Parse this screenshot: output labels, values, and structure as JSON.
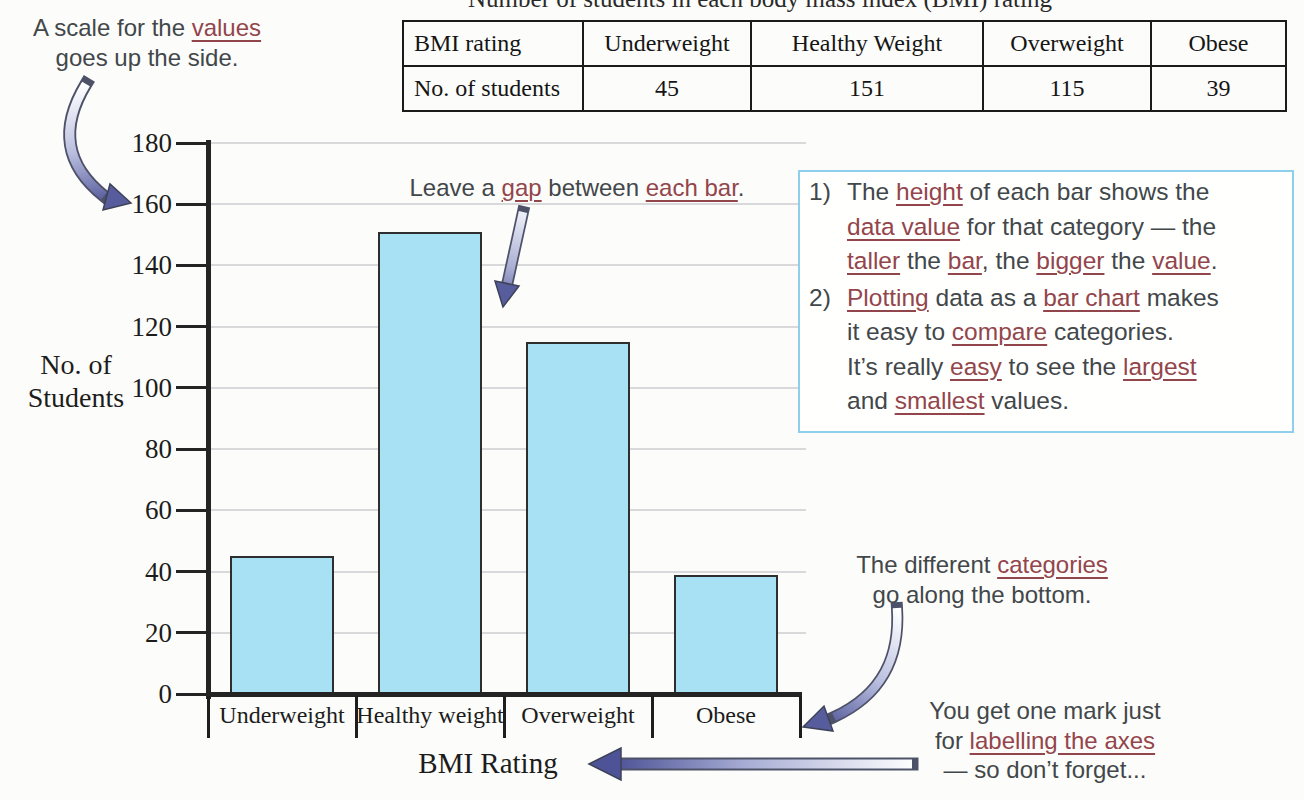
{
  "page": {
    "background": "#fcfcfa"
  },
  "colors": {
    "maroon": "#93454c",
    "text_dark": "#42474a",
    "serif_text": "#1c1c1c",
    "box_border": "#8ecfec",
    "arrow_outline": "#4e5268",
    "arrow_head": "#565c9c",
    "bar_fill": "#a8e1f3",
    "bar_border": "#2e2e2e",
    "grid": "#d8d9da",
    "axis": "#242424"
  },
  "top_caption": {
    "text": "Number of students in each body mass index (BMI) rating"
  },
  "table": {
    "rows": [
      {
        "cells": [
          "BMI rating",
          "Underweight",
          "Healthy Weight",
          "Overweight",
          "Obese"
        ]
      },
      {
        "cells": [
          "No. of students",
          "45",
          "151",
          "115",
          "39"
        ]
      }
    ]
  },
  "annotations": {
    "scale": {
      "lines": [
        [
          {
            "t": "A scale for the "
          },
          {
            "t": "values",
            "u": true
          }
        ],
        [
          {
            "t": "goes up the side."
          }
        ]
      ]
    },
    "gap": {
      "lines": [
        [
          {
            "t": "Leave a "
          },
          {
            "t": "gap",
            "u": true
          },
          {
            "t": " between "
          },
          {
            "t": "each bar",
            "u": true
          },
          {
            "t": "."
          }
        ]
      ]
    },
    "categories": {
      "lines": [
        [
          {
            "t": "The different "
          },
          {
            "t": "categories",
            "u": true
          }
        ],
        [
          {
            "t": "go along the bottom."
          }
        ]
      ]
    },
    "marks": {
      "lines": [
        [
          {
            "t": "You get one mark just"
          }
        ],
        [
          {
            "t": "for "
          },
          {
            "t": "labelling the axes",
            "u": true
          }
        ],
        [
          {
            "t": "— so don’t forget..."
          }
        ]
      ]
    }
  },
  "info_box": {
    "items": [
      {
        "num": "1)",
        "lines": [
          [
            {
              "t": "The "
            },
            {
              "t": "height",
              "u": true
            },
            {
              "t": " of each bar shows the"
            }
          ],
          [
            {
              "t": "data value",
              "u": true
            },
            {
              "t": " for that category — the"
            }
          ],
          [
            {
              "t": "taller",
              "u": true
            },
            {
              "t": " the "
            },
            {
              "t": "bar",
              "u": true
            },
            {
              "t": ", the "
            },
            {
              "t": "bigger",
              "u": true
            },
            {
              "t": " the "
            },
            {
              "t": "value",
              "u": true
            },
            {
              "t": "."
            }
          ]
        ]
      },
      {
        "num": "2)",
        "lines": [
          [
            {
              "t": "Plotting",
              "u": true
            },
            {
              "t": " data as a "
            },
            {
              "t": "bar chart",
              "u": true
            },
            {
              "t": " makes"
            }
          ],
          [
            {
              "t": "it easy to "
            },
            {
              "t": "compare",
              "u": true
            },
            {
              "t": " categories."
            }
          ],
          [
            {
              "t": "It’s really "
            },
            {
              "t": "easy",
              "u": true
            },
            {
              "t": " to see the "
            },
            {
              "t": "largest",
              "u": true
            }
          ],
          [
            {
              "t": "and "
            },
            {
              "t": "smallest",
              "u": true
            },
            {
              "t": " values."
            }
          ]
        ]
      }
    ]
  },
  "chart_data": {
    "type": "bar",
    "categories": [
      "Underweight",
      "Healthy weight",
      "Overweight",
      "Obese"
    ],
    "values": [
      45,
      151,
      115,
      39
    ],
    "xlabel": "BMI Rating",
    "ylabel": "No. of Students",
    "ylabel_lines": [
      "No. of",
      "Students"
    ],
    "ylim": [
      0,
      180
    ],
    "ytick_step": 20,
    "grid": true,
    "legend": false
  }
}
